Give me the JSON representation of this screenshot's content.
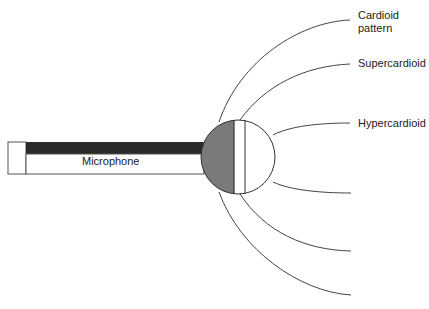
{
  "diagram": {
    "microphone_label": "Microphone",
    "patterns": [
      {
        "name": "cardioid",
        "label_line1": "Cardioid",
        "label_line2": "pattern"
      },
      {
        "name": "supercardioid",
        "label_line1": "Supercardioid"
      },
      {
        "name": "hypercardioid",
        "label_line1": "Hypercardioid"
      }
    ],
    "colors": {
      "stroke": "#333333",
      "dark_bar": "#2a2a2a",
      "capsule_gray": "#7a7a7a",
      "background": "#ffffff"
    }
  }
}
